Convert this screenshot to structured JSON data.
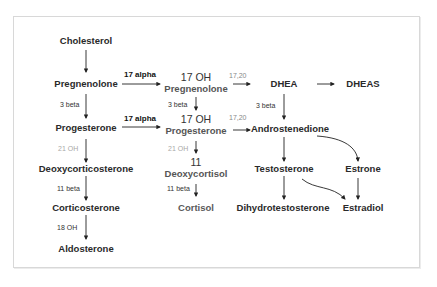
{
  "diagram": {
    "nodes": {
      "cholesterol": "Cholesterol",
      "pregnenolone": "Pregnenolone",
      "oh17_pregnenolone_l1": "17 OH",
      "oh17_pregnenolone_l2": "Pregnenolone",
      "dhea": "DHEA",
      "dheas": "DHEAS",
      "progesterone": "Progesterone",
      "oh17_progesterone_l1": "17 OH",
      "oh17_progesterone_l2": "Progesterone",
      "androstenedione": "Androstenedione",
      "deoxycorticosterone": "Deoxycorticosterone",
      "deoxycortisol_l1": "11",
      "deoxycortisol_l2": "Deoxycortisol",
      "testosterone": "Testosterone",
      "estrone": "Estrone",
      "corticosterone": "Corticosterone",
      "cortisol": "Cortisol",
      "dihydrotestosterone": "Dihydrotestosterone",
      "estradiol": "Estradiol",
      "aldosterone": "Aldosterone"
    },
    "enzymes": {
      "alpha17_a": "17 alpha",
      "alpha17_b": "17 alpha",
      "lyase_a": "17,20",
      "lyase_b": "17,20",
      "beta3_a": "3 beta",
      "beta3_b": "3 beta",
      "beta3_c": "3 beta",
      "oh21_a": "21 OH",
      "oh21_b": "21 OH",
      "beta11_a": "11 beta",
      "beta11_b": "11 beta",
      "oh18": "18 OH"
    },
    "colors": {
      "text": "#2a2a2a",
      "arrow": "#222222",
      "muted_label": "#a8a8a8",
      "frame": "#d8d8d8"
    }
  }
}
